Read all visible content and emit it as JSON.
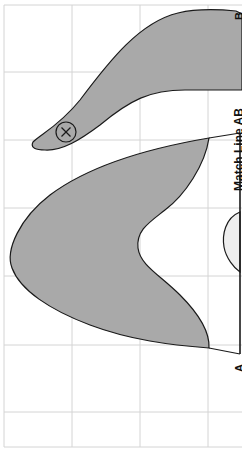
{
  "diagram": {
    "labels": {
      "point_a": "A",
      "point_b": "B",
      "match_line": "Match Line AB"
    },
    "symbols": {
      "marker": "circled-x"
    },
    "colors": {
      "background": "#ffffff",
      "grid": "#d4d4d4",
      "dark_fill": "#a9a9a9",
      "light_fill": "#eeeeee",
      "outline": "#1a1a1a"
    },
    "grid": {
      "vertical_lines_x": [
        4,
        72,
        140,
        208
      ],
      "horizontal_lines_y": [
        5,
        72,
        140,
        208,
        276,
        345,
        412,
        447
      ]
    }
  }
}
